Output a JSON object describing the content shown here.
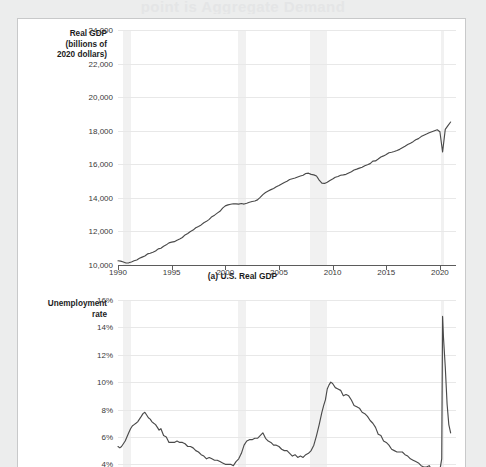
{
  "ghost_heading": "point is Aggregate Demand",
  "figure": {
    "panels": [
      {
        "id": "panel-a",
        "caption": "(a) U.S. Real GDP",
        "axis_label_lines": [
          "Real GDP",
          "(billions of",
          "2020 dollars)"
        ],
        "chart_index": 0
      },
      {
        "id": "panel-b",
        "caption": "",
        "axis_label_lines": [
          "Unemployment",
          "rate"
        ],
        "chart_index": 1
      }
    ]
  },
  "chart_data": [
    {
      "type": "line",
      "title": "(a) U.S. Real GDP",
      "xlabel": "",
      "ylabel": "Real GDP (billions of 2020 dollars)",
      "xlim": [
        1990,
        2021.5
      ],
      "ylim": [
        10000,
        24000
      ],
      "yticks": [
        "10,000",
        "12,000",
        "14,000",
        "16,000",
        "18,000",
        "20,000",
        "22,000",
        "24,000"
      ],
      "ytick_values": [
        10000,
        12000,
        14000,
        16000,
        18000,
        20000,
        22000,
        24000
      ],
      "xticks": [
        "1990",
        "1995",
        "2000",
        "2005",
        "2010",
        "2015",
        "2020"
      ],
      "xtick_values": [
        1990,
        1995,
        2000,
        2005,
        2010,
        2015,
        2020
      ],
      "grid": true,
      "legend": "none",
      "line_color": "#4a4a4a",
      "recession_bands": [
        {
          "start": 1990.5,
          "end": 1991.2
        },
        {
          "start": 2001.2,
          "end": 2001.9
        },
        {
          "start": 2007.9,
          "end": 2009.5
        },
        {
          "start": 2020.1,
          "end": 2020.4
        }
      ],
      "x": [
        1990.0,
        1990.25,
        1990.5,
        1990.75,
        1991.0,
        1991.25,
        1991.5,
        1991.75,
        1992.0,
        1992.25,
        1992.5,
        1992.75,
        1993.0,
        1993.25,
        1993.5,
        1993.75,
        1994.0,
        1994.25,
        1994.5,
        1994.75,
        1995.0,
        1995.25,
        1995.5,
        1995.75,
        1996.0,
        1996.25,
        1996.5,
        1996.75,
        1997.0,
        1997.25,
        1997.5,
        1997.75,
        1998.0,
        1998.25,
        1998.5,
        1998.75,
        1999.0,
        1999.25,
        1999.5,
        1999.75,
        2000.0,
        2000.25,
        2000.5,
        2000.75,
        2001.0,
        2001.25,
        2001.5,
        2001.75,
        2002.0,
        2002.25,
        2002.5,
        2002.75,
        2003.0,
        2003.25,
        2003.5,
        2003.75,
        2004.0,
        2004.25,
        2004.5,
        2004.75,
        2005.0,
        2005.25,
        2005.5,
        2005.75,
        2006.0,
        2006.25,
        2006.5,
        2006.75,
        2007.0,
        2007.25,
        2007.5,
        2007.75,
        2008.0,
        2008.25,
        2008.5,
        2008.75,
        2009.0,
        2009.25,
        2009.5,
        2009.75,
        2010.0,
        2010.25,
        2010.5,
        2010.75,
        2011.0,
        2011.25,
        2011.5,
        2011.75,
        2012.0,
        2012.25,
        2012.5,
        2012.75,
        2013.0,
        2013.25,
        2013.5,
        2013.75,
        2014.0,
        2014.25,
        2014.5,
        2014.75,
        2015.0,
        2015.25,
        2015.5,
        2015.75,
        2016.0,
        2016.25,
        2016.5,
        2016.75,
        2017.0,
        2017.25,
        2017.5,
        2017.75,
        2018.0,
        2018.25,
        2018.5,
        2018.75,
        2019.0,
        2019.25,
        2019.5,
        2019.75,
        2020.0,
        2020.25,
        2020.5,
        2020.75,
        2021.0
      ],
      "y": [
        10250,
        10230,
        10180,
        10120,
        10130,
        10180,
        10250,
        10300,
        10400,
        10470,
        10540,
        10660,
        10700,
        10760,
        10830,
        10960,
        11000,
        11120,
        11200,
        11320,
        11360,
        11390,
        11480,
        11550,
        11640,
        11790,
        11880,
        12000,
        12080,
        12220,
        12300,
        12390,
        12520,
        12600,
        12720,
        12880,
        12970,
        13090,
        13200,
        13390,
        13520,
        13580,
        13620,
        13650,
        13640,
        13630,
        13660,
        13630,
        13680,
        13740,
        13780,
        13810,
        13880,
        14030,
        14190,
        14320,
        14410,
        14490,
        14560,
        14660,
        14740,
        14830,
        14920,
        14990,
        15090,
        15140,
        15180,
        15240,
        15300,
        15350,
        15450,
        15470,
        15400,
        15370,
        15300,
        15060,
        14880,
        14860,
        14930,
        15030,
        15120,
        15230,
        15270,
        15350,
        15370,
        15400,
        15480,
        15560,
        15660,
        15710,
        15770,
        15820,
        15910,
        15970,
        16040,
        16190,
        16200,
        16310,
        16430,
        16500,
        16580,
        16690,
        16720,
        16760,
        16820,
        16890,
        16990,
        17080,
        17180,
        17260,
        17350,
        17460,
        17530,
        17650,
        17730,
        17800,
        17880,
        17940,
        18000,
        18060,
        17940,
        16730,
        18080,
        18300,
        18520
      ]
    },
    {
      "type": "line",
      "title": "",
      "xlabel": "",
      "ylabel": "Unemployment rate",
      "xlim": [
        1990,
        2021.5
      ],
      "ylim": [
        3.0,
        16.0
      ],
      "yticks": [
        "4%",
        "6%",
        "8%",
        "10%",
        "12%",
        "14%",
        "16%"
      ],
      "ytick_values": [
        4,
        6,
        8,
        10,
        12,
        14,
        16
      ],
      "xticks": [
        "1990",
        "1995",
        "2000",
        "2005",
        "2010",
        "2015",
        "2020"
      ],
      "xtick_values": [
        1990,
        1995,
        2000,
        2005,
        2010,
        2015,
        2020
      ],
      "grid": true,
      "legend": "none",
      "line_color": "#4a4a4a",
      "recession_bands": [
        {
          "start": 1990.5,
          "end": 1991.2
        },
        {
          "start": 2001.2,
          "end": 2001.9
        },
        {
          "start": 2007.9,
          "end": 2009.5
        },
        {
          "start": 2020.1,
          "end": 2020.4
        }
      ],
      "x": [
        1990.0,
        1990.17,
        1990.33,
        1990.5,
        1990.67,
        1990.83,
        1991.0,
        1991.17,
        1991.33,
        1991.5,
        1991.67,
        1991.83,
        1992.0,
        1992.17,
        1992.33,
        1992.5,
        1992.67,
        1992.83,
        1993.0,
        1993.17,
        1993.33,
        1993.5,
        1993.67,
        1993.83,
        1994.0,
        1994.25,
        1994.5,
        1994.75,
        1995.0,
        1995.25,
        1995.5,
        1995.75,
        1996.0,
        1996.25,
        1996.5,
        1996.75,
        1997.0,
        1997.25,
        1997.5,
        1997.75,
        1998.0,
        1998.25,
        1998.5,
        1998.75,
        1999.0,
        1999.25,
        1999.5,
        1999.75,
        2000.0,
        2000.25,
        2000.5,
        2000.75,
        2001.0,
        2001.25,
        2001.5,
        2001.75,
        2002.0,
        2002.25,
        2002.5,
        2002.75,
        2003.0,
        2003.25,
        2003.5,
        2003.75,
        2004.0,
        2004.25,
        2004.5,
        2004.75,
        2005.0,
        2005.25,
        2005.5,
        2005.75,
        2006.0,
        2006.25,
        2006.5,
        2006.75,
        2007.0,
        2007.25,
        2007.5,
        2007.75,
        2008.0,
        2008.25,
        2008.5,
        2008.75,
        2009.0,
        2009.17,
        2009.33,
        2009.5,
        2009.67,
        2009.83,
        2010.0,
        2010.25,
        2010.5,
        2010.75,
        2011.0,
        2011.25,
        2011.5,
        2011.75,
        2012.0,
        2012.25,
        2012.5,
        2012.75,
        2013.0,
        2013.25,
        2013.5,
        2013.75,
        2014.0,
        2014.25,
        2014.5,
        2014.75,
        2015.0,
        2015.25,
        2015.5,
        2015.75,
        2016.0,
        2016.25,
        2016.5,
        2016.75,
        2017.0,
        2017.25,
        2017.5,
        2017.75,
        2018.0,
        2018.25,
        2018.5,
        2018.75,
        2019.0,
        2019.25,
        2019.5,
        2019.75,
        2020.0,
        2020.17,
        2020.25,
        2020.33,
        2020.5,
        2020.67,
        2020.83,
        2021.0
      ],
      "y": [
        5.3,
        5.2,
        5.3,
        5.5,
        5.7,
        6.0,
        6.3,
        6.6,
        6.8,
        6.9,
        7.0,
        7.1,
        7.3,
        7.5,
        7.7,
        7.8,
        7.6,
        7.4,
        7.3,
        7.1,
        7.0,
        6.9,
        6.7,
        6.5,
        6.6,
        6.1,
        6.0,
        5.6,
        5.6,
        5.6,
        5.7,
        5.6,
        5.6,
        5.5,
        5.3,
        5.3,
        5.2,
        5.0,
        4.9,
        4.7,
        4.6,
        4.4,
        4.5,
        4.4,
        4.3,
        4.3,
        4.2,
        4.1,
        4.0,
        4.0,
        4.0,
        3.9,
        4.2,
        4.4,
        4.8,
        5.4,
        5.7,
        5.8,
        5.8,
        5.9,
        5.9,
        6.1,
        6.3,
        5.9,
        5.7,
        5.6,
        5.4,
        5.4,
        5.3,
        5.1,
        5.0,
        5.0,
        4.8,
        4.6,
        4.7,
        4.5,
        4.6,
        4.5,
        4.7,
        4.8,
        5.0,
        5.4,
        6.1,
        6.9,
        7.8,
        8.3,
        8.7,
        9.5,
        9.8,
        10.0,
        9.9,
        9.6,
        9.5,
        9.4,
        9.0,
        9.1,
        9.0,
        8.7,
        8.3,
        8.2,
        8.1,
        7.8,
        7.7,
        7.5,
        7.2,
        7.0,
        6.7,
        6.2,
        6.1,
        5.7,
        5.6,
        5.4,
        5.1,
        5.0,
        4.9,
        4.9,
        4.9,
        4.7,
        4.6,
        4.4,
        4.3,
        4.2,
        4.1,
        3.9,
        3.8,
        3.8,
        3.9,
        3.6,
        3.6,
        3.5,
        3.6,
        4.4,
        14.8,
        13.3,
        11.1,
        8.4,
        6.9,
        6.3
      ]
    }
  ]
}
